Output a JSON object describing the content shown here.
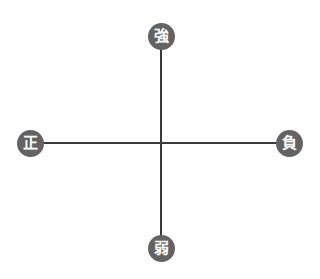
{
  "diagram": {
    "type": "quadrant-axes",
    "colors": {
      "node_fill": "#636363",
      "node_text": "#ffffff",
      "axis_line": "#3a3a3a",
      "background": "#ffffff"
    },
    "nodes": {
      "top": {
        "label": "強",
        "position": "top"
      },
      "bottom": {
        "label": "弱",
        "position": "bottom"
      },
      "left": {
        "label": "正",
        "position": "left"
      },
      "right": {
        "label": "負",
        "position": "right"
      }
    },
    "axes": {
      "vertical": {
        "from": "強",
        "to": "弱"
      },
      "horizontal": {
        "from": "正",
        "to": "負"
      }
    }
  }
}
